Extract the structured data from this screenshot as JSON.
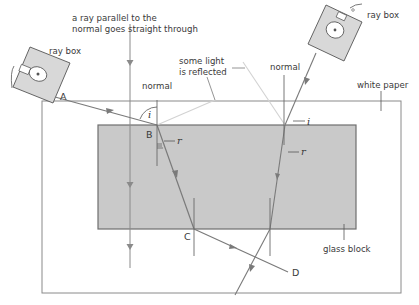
{
  "diagram": {
    "labels": {
      "parallel_ray_line1": "a ray parallel to the",
      "parallel_ray_line2": "normal goes straight through",
      "ray_box_left": "ray box",
      "ray_box_right": "ray box",
      "reflected_line1": "some light",
      "reflected_line2": "is reflected",
      "normal_left": "normal",
      "normal_right": "normal",
      "white_paper": "white paper",
      "glass_block": "glass block",
      "angle_i_left": "i",
      "angle_r_left": "r",
      "angle_i_right": "i",
      "angle_r_right": "r",
      "point_A": "A",
      "point_B": "B",
      "point_C": "C",
      "point_D": "D"
    },
    "colors": {
      "paper_fill": "#ffffff",
      "paper_border": "#8a8a8a",
      "glass_fill": "#c9c9c9",
      "glass_border": "#6f6f6f",
      "ray": "#7a7a7a",
      "reflected_ray": "#d2d2d2",
      "text": "#3a3a3a",
      "ray_box_fill": "#d8d8d8"
    }
  }
}
